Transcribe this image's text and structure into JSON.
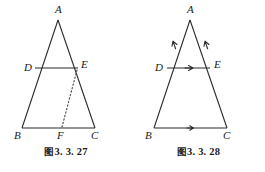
{
  "page": {
    "background_color": "#ffffff",
    "stroke_color": "#2b2b2b",
    "label_color": "#1a1a1a"
  },
  "figures": [
    {
      "id": "figure-3-3-27",
      "caption_cjk": "图",
      "caption_number": "3. 3. 27",
      "caption_full": "图 3. 3. 27",
      "description": "Triangle ABC with segment DE parallel to BC and a dotted segment from E to F on BC",
      "vertices": [
        {
          "name": "A",
          "label": "A",
          "x": 58,
          "y": 20,
          "label_x": 55,
          "label_y": 13
        },
        {
          "name": "B",
          "label": "B",
          "x": 22,
          "y": 128,
          "label_x": 14,
          "label_y": 139
        },
        {
          "name": "C",
          "label": "C",
          "x": 95,
          "y": 128,
          "label_x": 91,
          "label_y": 139
        },
        {
          "name": "D",
          "label": "D",
          "x": 35,
          "y": 68,
          "label_x": 24,
          "label_y": 71
        },
        {
          "name": "E",
          "label": "E",
          "x": 78,
          "y": 68,
          "label_x": 81,
          "label_y": 68
        },
        {
          "name": "F",
          "label": "F",
          "x": 62,
          "y": 128,
          "label_x": 57,
          "label_y": 139
        }
      ],
      "solid_segments": [
        {
          "name": "side-AB",
          "from": "A",
          "to": "B"
        },
        {
          "name": "side-AC",
          "from": "A",
          "to": "C"
        },
        {
          "name": "side-BC",
          "from": "B",
          "to": "C"
        },
        {
          "name": "segment-DE",
          "from": "D",
          "to": "E"
        }
      ],
      "dotted_segments": [
        {
          "name": "segment-EF",
          "from": "E",
          "to": "F"
        }
      ],
      "arrow_marks": []
    },
    {
      "id": "figure-3-3-28",
      "caption_cjk": "图",
      "caption_number": "3. 3. 28",
      "caption_full": "图 3. 3. 28",
      "description": "Triangle ABC with segment DE parallel to BC, direction arrows on AB, AC, DE and BC",
      "vertices": [
        {
          "name": "A",
          "label": "A",
          "x": 58,
          "y": 20,
          "label_x": 55,
          "label_y": 13
        },
        {
          "name": "B",
          "label": "B",
          "x": 22,
          "y": 128,
          "label_x": 13,
          "label_y": 139
        },
        {
          "name": "C",
          "label": "C",
          "x": 95,
          "y": 128,
          "label_x": 91,
          "label_y": 139
        },
        {
          "name": "D",
          "label": "D",
          "x": 35,
          "y": 68,
          "label_x": 23,
          "label_y": 71
        },
        {
          "name": "E",
          "label": "E",
          "x": 78,
          "y": 68,
          "label_x": 82,
          "label_y": 68
        }
      ],
      "solid_segments": [
        {
          "name": "side-AB",
          "from": "A",
          "to": "B"
        },
        {
          "name": "side-AC",
          "from": "A",
          "to": "C"
        },
        {
          "name": "side-BC",
          "from": "B",
          "to": "C"
        },
        {
          "name": "segment-DE",
          "from": "D",
          "to": "E"
        }
      ],
      "dotted_segments": [],
      "arrow_marks": [
        {
          "name": "arrow-on-AB",
          "x": 41,
          "y": 46,
          "angle": -108,
          "direction": "toward-A"
        },
        {
          "name": "arrow-on-AC",
          "x": 74,
          "y": 46,
          "angle": -72,
          "direction": "toward-A"
        },
        {
          "name": "arrow-on-DE",
          "x": 57,
          "y": 68,
          "angle": 0,
          "direction": "toward-E"
        },
        {
          "name": "arrow-on-BC",
          "x": 59,
          "y": 128,
          "angle": 0,
          "direction": "toward-C"
        }
      ]
    }
  ]
}
